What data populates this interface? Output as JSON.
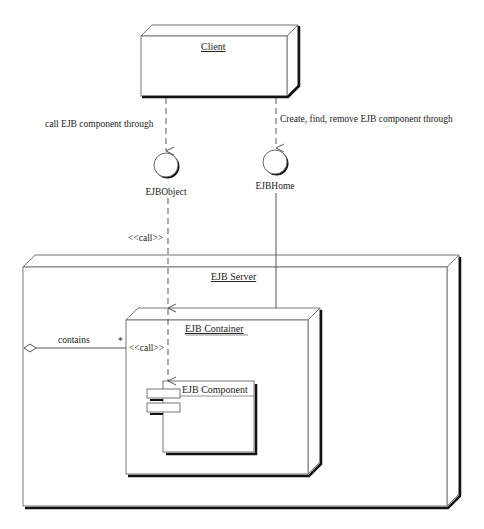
{
  "diagram": {
    "type": "UML deployment diagram",
    "nodes": {
      "client": {
        "title": "Client"
      },
      "server": {
        "title": "EJB Server"
      },
      "container": {
        "title": "EJB Container"
      },
      "component": {
        "title": "EJB Component"
      }
    },
    "interfaces": {
      "ejb_object": {
        "label": "EJBObject"
      },
      "ejb_home": {
        "label": "EJBHome"
      }
    },
    "edges": {
      "client_to_object": {
        "label": "call EJB component through"
      },
      "client_to_home": {
        "label": "Create, find, remove EJB component through"
      },
      "object_to_container": {
        "label": "<<call>>"
      },
      "container_to_component": {
        "label": "<<call>>"
      },
      "server_contains_container": {
        "label": "contains",
        "multiplicity": "*"
      }
    }
  }
}
